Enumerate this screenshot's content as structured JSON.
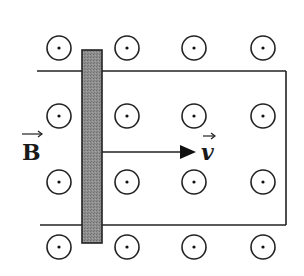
{
  "diagram": {
    "type": "moving-rod-on-rails-in-magnetic-field",
    "field": {
      "label": "B",
      "vector_arrow": true,
      "direction": "out-of-page",
      "symbol": "dot-in-circle",
      "grid": {
        "columns_x": [
          59,
          127,
          194,
          263
        ],
        "rows_y": [
          48,
          116,
          182,
          247
        ],
        "radius": 12
      }
    },
    "rails": {
      "top_y": 71,
      "bottom_y": 225,
      "left_x_top": 37,
      "left_x_bottom": 40,
      "right_x": 286,
      "closed_end": "right"
    },
    "rod": {
      "x": 82,
      "y": 50,
      "width": 20,
      "height": 193,
      "fill": "#8c8c8c",
      "stroke": "#222222"
    },
    "velocity": {
      "label": "v",
      "vector_arrow": true,
      "direction": "right",
      "from_x": 102,
      "to_x": 194,
      "y": 152
    },
    "colors": {
      "line": "#222222",
      "background": "#ffffff"
    }
  }
}
